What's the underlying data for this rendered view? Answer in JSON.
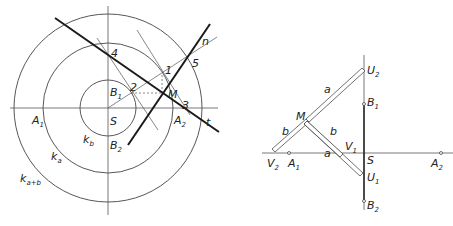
{
  "left_figure": {
    "labels": {
      "S": {
        "main": "S",
        "sub": ""
      },
      "A1": {
        "main": "A",
        "sub": "1"
      },
      "A2": {
        "main": "A",
        "sub": "2"
      },
      "B1": {
        "main": "B",
        "sub": "1"
      },
      "B2": {
        "main": "B",
        "sub": "2"
      },
      "M": {
        "main": "M",
        "sub": ""
      },
      "p1": {
        "main": "1",
        "sub": ""
      },
      "p2": {
        "main": "2",
        "sub": ""
      },
      "p3": {
        "main": "3",
        "sub": ""
      },
      "p4": {
        "main": "4",
        "sub": ""
      },
      "p5": {
        "main": "5",
        "sub": ""
      },
      "n": {
        "main": "n",
        "sub": ""
      },
      "t": {
        "main": "t",
        "sub": ""
      },
      "kb": {
        "main": "k",
        "sub": "b"
      },
      "ka": {
        "main": "k",
        "sub": "a"
      },
      "kab": {
        "main": "k",
        "sub": "a+b"
      }
    }
  },
  "right_figure": {
    "labels": {
      "U2": {
        "main": "U",
        "sub": "2"
      },
      "U1": {
        "main": "U",
        "sub": "1"
      },
      "B1": {
        "main": "B",
        "sub": "1"
      },
      "B2": {
        "main": "B",
        "sub": "2"
      },
      "M": {
        "main": "M",
        "sub": ""
      },
      "S": {
        "main": "S",
        "sub": ""
      },
      "V1": {
        "main": "V",
        "sub": "1"
      },
      "V2": {
        "main": "V",
        "sub": "2"
      },
      "A1": {
        "main": "A",
        "sub": "1"
      },
      "A2": {
        "main": "A",
        "sub": "2"
      },
      "a_upper": {
        "main": "a",
        "sub": ""
      },
      "a_lower": {
        "main": "a",
        "sub": ""
      },
      "b_left": {
        "main": "b",
        "sub": ""
      },
      "b_right": {
        "main": "b",
        "sub": ""
      }
    }
  }
}
